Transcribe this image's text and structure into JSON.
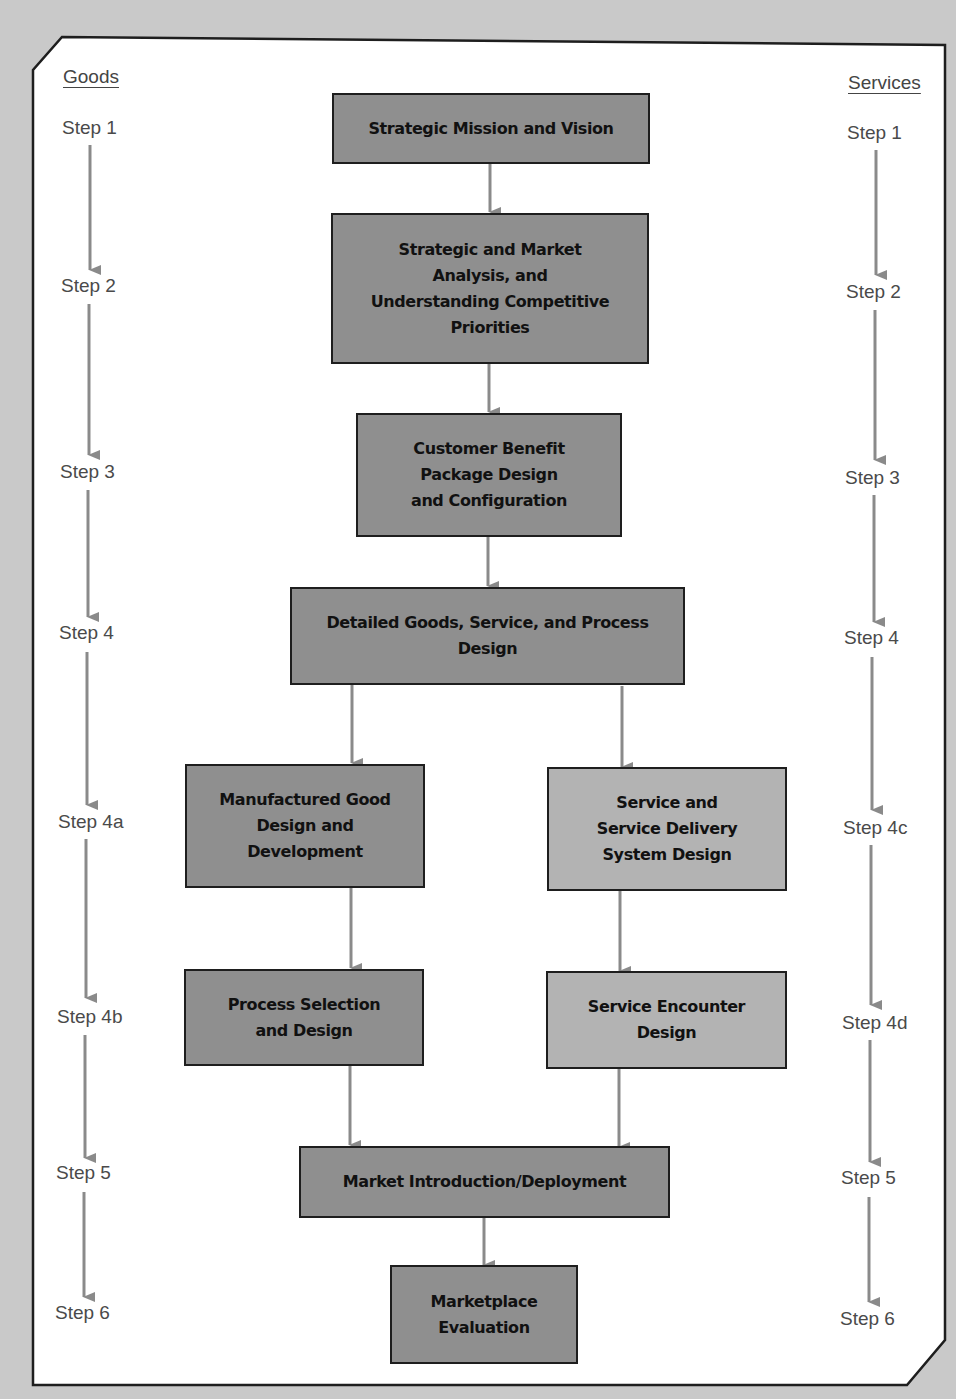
{
  "columns": {
    "goods": {
      "heading": "Goods",
      "steps": [
        "Step 1",
        "Step 2",
        "Step 3",
        "Step 4",
        "Step 4a",
        "Step 4b",
        "Step 5",
        "Step 6"
      ]
    },
    "services": {
      "heading": "Services",
      "steps": [
        "Step 1",
        "Step 2",
        "Step 3",
        "Step 4",
        "Step 4c",
        "Step 4d",
        "Step 5",
        "Step 6"
      ]
    }
  },
  "boxes": {
    "mission": [
      "Strategic Mission and Vision"
    ],
    "analysis": [
      "Strategic and Market",
      "Analysis, and",
      "Understanding Competitive",
      "Priorities"
    ],
    "cbp": [
      "Customer Benefit",
      "Package Design",
      "and Configuration"
    ],
    "detailed": [
      "Detailed Goods, Service, and Process",
      "Design"
    ],
    "manufactured": [
      "Manufactured Good",
      "Design and",
      "Development"
    ],
    "service_delivery": [
      "Service and",
      "Service Delivery",
      "System Design"
    ],
    "process_selection": [
      "Process Selection",
      "and Design"
    ],
    "service_encounter": [
      "Service Encounter",
      "Design"
    ],
    "market_intro": [
      "Market Introduction/Deployment"
    ],
    "evaluation": [
      "Marketplace",
      "Evaluation"
    ]
  },
  "colors": {
    "page_background": "#c9c9c9",
    "frame_fill": "#ffffff",
    "frame_border": "#1e1e1e",
    "box_dark": "#8f8f8f",
    "box_light": "#b3b3b3",
    "arrow": "#8a8a8a",
    "step_text": "#4a4a4a"
  }
}
